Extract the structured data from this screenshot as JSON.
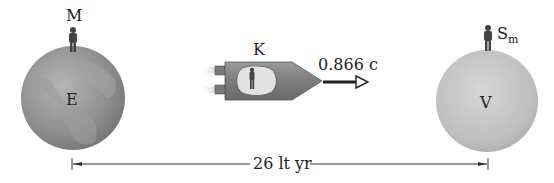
{
  "diagram": {
    "earth": {
      "label": "E",
      "observer_label": "M"
    },
    "rocket": {
      "label": "K",
      "speed_label": "0.866 c"
    },
    "planet": {
      "label": "V",
      "observer_label": "S",
      "observer_subscript": "m"
    },
    "distance": {
      "label": "26 lt yr"
    }
  },
  "colors": {
    "earth": "#8f8f8f",
    "planet": "#c4c4c4",
    "rocket": "#8a8a8a",
    "line": "#333333"
  }
}
